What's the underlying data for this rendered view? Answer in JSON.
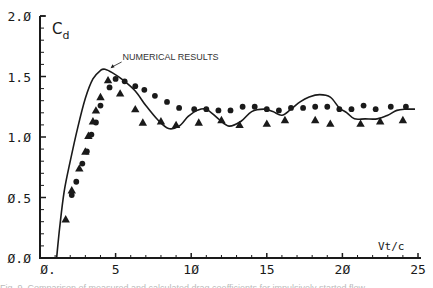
{
  "chart_data": {
    "type": "scatter",
    "title": "",
    "xlabel": "Vt/c",
    "ylabel": "Cd",
    "xlim": [
      0,
      25
    ],
    "ylim": [
      0,
      2.0
    ],
    "x_ticks": [
      "0.",
      "5",
      "10",
      "15",
      "20",
      "25"
    ],
    "y_ticks": [
      "0.0",
      "0.5",
      "1.0",
      "1.5",
      "2.0"
    ],
    "grid": false,
    "legend": null,
    "annotations": [
      {
        "text": "NUMERICAL RESULTS",
        "x": 5.2,
        "y": 1.62,
        "arrow_to": [
          4.6,
          1.56
        ]
      }
    ],
    "series": [
      {
        "name": "Numerical results",
        "kind": "line",
        "x": [
          1.1,
          1.3,
          1.6,
          2.0,
          2.5,
          3.0,
          3.5,
          4.0,
          4.3,
          4.8,
          5.5,
          6.3,
          7.0,
          7.8,
          8.5,
          9.2,
          9.8,
          10.4,
          11.0,
          11.8,
          12.5,
          13.3,
          14.0,
          14.8,
          15.4,
          16.0,
          16.6,
          17.2,
          17.8,
          18.5,
          19.2,
          19.8,
          20.3,
          20.8,
          21.5,
          22.3,
          23.0,
          23.6,
          24.2,
          24.8
        ],
        "y": [
          0.0,
          0.25,
          0.55,
          0.8,
          1.08,
          1.32,
          1.48,
          1.55,
          1.56,
          1.53,
          1.47,
          1.38,
          1.26,
          1.14,
          1.07,
          1.09,
          1.17,
          1.22,
          1.23,
          1.15,
          1.09,
          1.13,
          1.21,
          1.23,
          1.21,
          1.18,
          1.23,
          1.29,
          1.33,
          1.35,
          1.33,
          1.24,
          1.2,
          1.15,
          1.15,
          1.15,
          1.18,
          1.22,
          1.23,
          1.23
        ]
      },
      {
        "name": "Experiment (circles)",
        "kind": "scatter",
        "marker": "circle",
        "x": [
          2.1,
          2.4,
          2.8,
          3.1,
          3.4,
          3.7,
          4.0,
          4.6,
          5.0,
          5.6,
          6.3,
          6.9,
          7.6,
          8.4,
          9.2,
          10.2,
          11.0,
          11.8,
          12.6,
          13.4,
          14.2,
          15.0,
          15.8,
          16.6,
          17.4,
          18.2,
          19.0,
          19.8,
          20.6,
          21.4,
          22.2,
          23.2,
          24.2
        ],
        "y": [
          0.52,
          0.63,
          0.78,
          0.88,
          1.02,
          1.12,
          1.26,
          1.41,
          1.48,
          1.46,
          1.42,
          1.39,
          1.34,
          1.29,
          1.24,
          1.23,
          1.23,
          1.22,
          1.22,
          1.25,
          1.25,
          1.23,
          1.22,
          1.24,
          1.24,
          1.25,
          1.25,
          1.23,
          1.23,
          1.26,
          1.23,
          1.25,
          1.25
        ]
      },
      {
        "name": "Experiment (triangles)",
        "kind": "scatter",
        "marker": "triangle",
        "x": [
          1.7,
          2.1,
          2.6,
          3.0,
          3.2,
          3.5,
          3.7,
          4.0,
          4.5,
          5.3,
          6.3,
          6.8,
          8.0,
          9.0,
          10.5,
          12.0,
          13.2,
          15.0,
          16.2,
          18.2,
          19.2,
          21.2,
          22.5,
          24.0
        ],
        "y": [
          0.32,
          0.56,
          0.74,
          0.88,
          1.01,
          1.13,
          1.22,
          1.33,
          1.47,
          1.36,
          1.23,
          1.12,
          1.13,
          1.1,
          1.12,
          1.14,
          1.1,
          1.11,
          1.14,
          1.14,
          1.11,
          1.11,
          1.13,
          1.14
        ]
      }
    ]
  },
  "caption": {
    "text": "Fig. 9. Comparison of measured and calculated drag coefficients for impulsively started flow"
  }
}
